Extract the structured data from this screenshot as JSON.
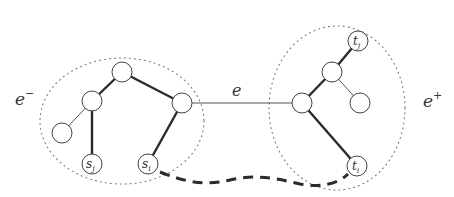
{
  "diagram": {
    "type": "tree-split-diagram",
    "labels": {
      "left_component": "e",
      "left_component_sup": "−",
      "right_component": "e",
      "right_component_sup": "+",
      "edge": "e"
    },
    "nodes": {
      "s_j": {
        "base": "s",
        "sub": "j"
      },
      "s_i": {
        "base": "s",
        "sub": "i"
      },
      "t_j": {
        "base": "t",
        "sub": "j"
      },
      "t_i": {
        "base": "t",
        "sub": "i"
      }
    },
    "colors": {
      "stroke": "#2b2b2b",
      "dotted": "#777777",
      "background": "#ffffff"
    }
  }
}
